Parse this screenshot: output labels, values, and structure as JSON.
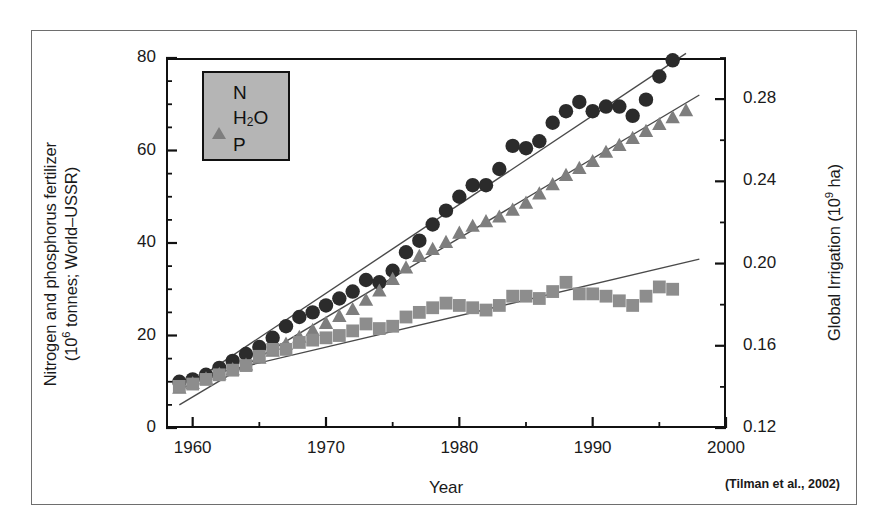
{
  "figure": {
    "citation": "(Tilman et al., 2002)"
  },
  "axes": {
    "xlabel": "Year",
    "ylabel_left_line1": "Nitrogen and phosphorus fertilizer",
    "ylabel_left_line2_pre": "(10",
    "ylabel_left_line2_exp": "6",
    "ylabel_left_line2_post": " tonnes; World–USSR)",
    "ylabel_right_pre": "Global Irrigation (10",
    "ylabel_right_exp": "9",
    "ylabel_right_post": " ha)",
    "xticks": [
      "1960",
      "1970",
      "1980",
      "1990",
      "2000"
    ],
    "yticks_left": [
      "0",
      "20",
      "40",
      "60",
      "80"
    ],
    "yticks_right": [
      "0.12",
      "0.16",
      "0.20",
      "0.24",
      "0.28"
    ]
  },
  "legend": {
    "items": [
      {
        "label": "N",
        "marker": "circle",
        "color": "#2b2b2b"
      },
      {
        "label": "H",
        "sub": "2",
        "label_tail": "O",
        "marker": "triangle",
        "color": "#7e7e7e"
      },
      {
        "label": "P",
        "marker": "square",
        "color": "#8d8d8d"
      }
    ]
  },
  "chart_data": {
    "type": "scatter",
    "title": "",
    "xlabel": "Year",
    "ylabel": "Nitrogen and phosphorus fertilizer (10^6 tonnes; World–USSR)",
    "ylabel_secondary": "Global Irrigation (10^9 ha)",
    "xlim": [
      1958,
      2000
    ],
    "ylim": [
      0,
      80
    ],
    "ylim_secondary": [
      0.12,
      0.3
    ],
    "grid": false,
    "legend_position": "top-left",
    "xticks": [
      1960,
      1970,
      1980,
      1990,
      2000
    ],
    "xticks_minor_step": 5,
    "yticks": [
      0,
      20,
      40,
      60,
      80
    ],
    "yticks_minor_step": 5,
    "yticks_secondary": [
      0.12,
      0.16,
      0.2,
      0.24,
      0.28
    ],
    "annotation": "(Tilman et al., 2002)",
    "series": [
      {
        "name": "N",
        "marker": "circle",
        "color": "#2b2b2b",
        "axis": "left",
        "x": [
          1959,
          1960,
          1961,
          1962,
          1963,
          1964,
          1965,
          1966,
          1967,
          1968,
          1969,
          1970,
          1971,
          1972,
          1973,
          1974,
          1975,
          1976,
          1977,
          1978,
          1979,
          1980,
          1981,
          1982,
          1983,
          1984,
          1985,
          1986,
          1987,
          1988,
          1989,
          1990,
          1991,
          1992,
          1993,
          1994,
          1995,
          1996
        ],
        "values": [
          10.0,
          10.5,
          11.5,
          13.0,
          14.5,
          16.0,
          17.5,
          19.5,
          22.0,
          24.0,
          25.0,
          26.5,
          28.0,
          29.5,
          32.0,
          31.5,
          34.0,
          38.0,
          40.5,
          44.0,
          47.0,
          50.0,
          52.5,
          52.5,
          56.0,
          61.0,
          60.5,
          62.0,
          66.0,
          68.5,
          70.5,
          68.5,
          69.5,
          69.5,
          67.5,
          71.0,
          76.0,
          79.5
        ],
        "trendline": {
          "x": [
            1959,
            1997
          ],
          "y": [
            8.0,
            81.0
          ]
        }
      },
      {
        "name": "H2O",
        "marker": "triangle",
        "color": "#7e7e7e",
        "axis": "right",
        "x": [
          1959,
          1960,
          1961,
          1962,
          1963,
          1964,
          1965,
          1966,
          1967,
          1968,
          1969,
          1970,
          1971,
          1972,
          1973,
          1974,
          1975,
          1976,
          1977,
          1978,
          1979,
          1980,
          1981,
          1982,
          1983,
          1984,
          1985,
          1986,
          1987,
          1988,
          1989,
          1990,
          1991,
          1992,
          1993,
          1994,
          1995,
          1996,
          1997
        ],
        "values_left_equiv": [
          8.5,
          9.5,
          10.5,
          11.5,
          12.5,
          13.5,
          15.0,
          16.5,
          18.0,
          19.5,
          21.0,
          22.5,
          24.0,
          25.5,
          27.5,
          29.5,
          32.0,
          34.5,
          37.0,
          38.5,
          40.0,
          42.0,
          43.5,
          44.5,
          45.5,
          47.0,
          48.5,
          50.5,
          52.5,
          54.5,
          56.0,
          57.5,
          59.5,
          61.0,
          62.5,
          64.0,
          65.5,
          67.0,
          68.5
        ],
        "values": [
          0.139,
          0.141,
          0.144,
          0.146,
          0.148,
          0.15,
          0.154,
          0.157,
          0.16,
          0.164,
          0.167,
          0.171,
          0.174,
          0.177,
          0.182,
          0.186,
          0.192,
          0.198,
          0.203,
          0.207,
          0.21,
          0.215,
          0.218,
          0.22,
          0.222,
          0.226,
          0.229,
          0.234,
          0.238,
          0.243,
          0.246,
          0.249,
          0.254,
          0.257,
          0.261,
          0.264,
          0.267,
          0.271,
          0.274
        ],
        "trendline": {
          "x": [
            1959,
            1998
          ],
          "y_left_equiv": [
            5.0,
            72.0
          ]
        }
      },
      {
        "name": "P",
        "marker": "square",
        "color": "#8d8d8d",
        "axis": "left",
        "x": [
          1959,
          1960,
          1961,
          1962,
          1963,
          1964,
          1965,
          1966,
          1967,
          1968,
          1969,
          1970,
          1971,
          1972,
          1973,
          1974,
          1975,
          1976,
          1977,
          1978,
          1979,
          1980,
          1981,
          1982,
          1983,
          1984,
          1985,
          1986,
          1987,
          1988,
          1989,
          1990,
          1991,
          1992,
          1993,
          1994,
          1995,
          1996
        ],
        "values": [
          9.0,
          9.5,
          10.5,
          11.5,
          12.5,
          13.5,
          15.5,
          17.0,
          17.0,
          18.5,
          19.0,
          19.5,
          20.0,
          21.0,
          22.5,
          21.5,
          22.0,
          24.0,
          25.0,
          26.0,
          27.0,
          26.5,
          26.0,
          25.5,
          26.5,
          28.5,
          28.5,
          28.0,
          29.5,
          31.5,
          29.0,
          29.0,
          28.5,
          27.5,
          26.5,
          28.5,
          30.5,
          30.0
        ],
        "trendline": {
          "x": [
            1959,
            1998
          ],
          "y": [
            10.0,
            36.5
          ]
        }
      }
    ]
  }
}
